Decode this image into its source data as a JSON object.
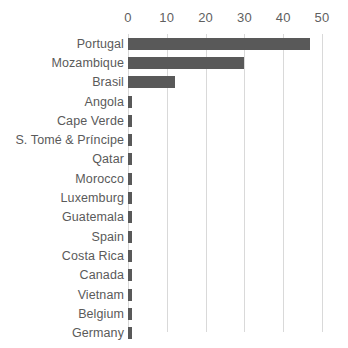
{
  "chart_data": {
    "type": "bar",
    "orientation": "horizontal",
    "title": "",
    "xlabel": "",
    "ylabel": "",
    "xlim": [
      0,
      50
    ],
    "xticks": [
      0,
      10,
      20,
      30,
      40,
      50
    ],
    "grid": true,
    "legend": false,
    "bar_color": "#595959",
    "label_color": "#5a5a5a",
    "gridline_color": "#d9d9d9",
    "categories": [
      "Portugal",
      "Mozambique",
      "Brasil",
      "Angola",
      "Cape Verde",
      "S. Tomé & Príncipe",
      "Qatar",
      "Morocco",
      "Luxemburg",
      "Guatemala",
      "Spain",
      "Costa Rica",
      "Canada",
      "Vietnam",
      "Belgium",
      "Germany"
    ],
    "values": [
      47,
      30,
      12,
      1,
      1,
      1,
      1,
      1,
      1,
      1,
      1,
      1,
      1,
      1,
      1,
      1
    ]
  }
}
